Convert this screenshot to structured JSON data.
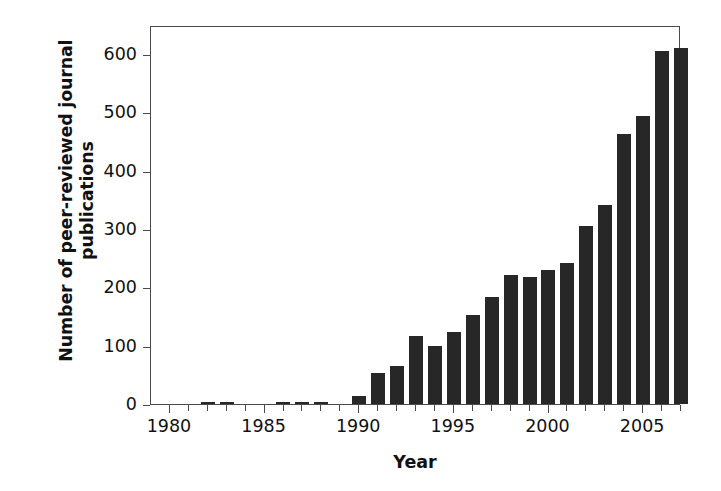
{
  "chart_data": {
    "type": "bar",
    "title": "",
    "xlabel": "Year",
    "ylabel": "Number of peer-reviewed journal\npublications",
    "ylabel_lines": [
      "Number of peer-reviewed journal",
      "publications"
    ],
    "categories": [
      1980,
      1981,
      1982,
      1983,
      1984,
      1985,
      1986,
      1987,
      1988,
      1989,
      1990,
      1991,
      1992,
      1993,
      1994,
      1995,
      1996,
      1997,
      1998,
      1999,
      2000,
      2001,
      2002,
      2003,
      2004,
      2005,
      2006,
      2007
    ],
    "values": [
      0,
      0,
      4,
      4,
      0,
      0,
      3,
      3,
      3,
      0,
      14,
      53,
      66,
      117,
      99,
      123,
      153,
      183,
      222,
      217,
      229,
      241,
      305,
      341,
      463,
      494,
      606,
      610
    ],
    "series": [
      {
        "name": "Peer-reviewed journal publications",
        "values": [
          0,
          0,
          4,
          4,
          0,
          0,
          3,
          3,
          3,
          0,
          14,
          53,
          66,
          117,
          99,
          123,
          153,
          183,
          222,
          217,
          229,
          241,
          305,
          341,
          463,
          494,
          606,
          610
        ]
      }
    ],
    "ylim": [
      0,
      650
    ],
    "xlim": [
      1979.5,
      2007.5
    ],
    "yticks": [
      0,
      100,
      200,
      300,
      400,
      500,
      600
    ],
    "ytick_labels": [
      "0",
      "100",
      "200",
      "300",
      "400",
      "500",
      "600"
    ],
    "xticks": [
      1980,
      1981,
      1982,
      1983,
      1984,
      1985,
      1986,
      1987,
      1988,
      1989,
      1990,
      1991,
      1992,
      1993,
      1994,
      1995,
      1996,
      1997,
      1998,
      1999,
      2000,
      2001,
      2002,
      2003,
      2004,
      2005,
      2006,
      2007
    ],
    "xtick_labels_shown": [
      "1980",
      "1985",
      "1990",
      "1995",
      "2000",
      "2005"
    ],
    "grid": false,
    "legend": false,
    "legend_position": "none",
    "bar_color": "#272727",
    "axis_color": "#4a4a4a",
    "background_color": "#ffffff"
  }
}
